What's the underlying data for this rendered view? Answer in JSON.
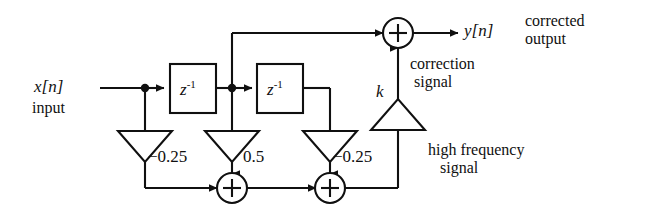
{
  "diagram": {
    "signals": {
      "input_label": "x[n]",
      "input_caption": "input",
      "output_label": "y[n]",
      "output_caption_line1": "corrected",
      "output_caption_line2": "output",
      "correction_line1": "correction",
      "correction_line2": "signal",
      "highfreq_line1": "high frequency",
      "highfreq_line2": "signal"
    },
    "delay_blocks": [
      {
        "name": "delay-1",
        "base": "z",
        "exponent": "-1"
      },
      {
        "name": "delay-2",
        "base": "z",
        "exponent": "-1"
      }
    ],
    "gains": [
      {
        "name": "gain-a",
        "value": "-0.25",
        "display": "−0.25",
        "orientation": "down"
      },
      {
        "name": "gain-b",
        "value": "0.5",
        "display": "0.5",
        "orientation": "down"
      },
      {
        "name": "gain-c",
        "value": "-0.25",
        "display": "−0.25",
        "orientation": "down"
      },
      {
        "name": "gain-k",
        "value": "k",
        "display": "k",
        "orientation": "up"
      }
    ],
    "adders": [
      {
        "name": "adder-bottom-left",
        "symbol": "+"
      },
      {
        "name": "adder-bottom-right",
        "symbol": "+"
      },
      {
        "name": "adder-output",
        "symbol": "+"
      }
    ],
    "colors": {
      "line": "#101010",
      "text": "#101010",
      "background": "#ffffff"
    }
  }
}
